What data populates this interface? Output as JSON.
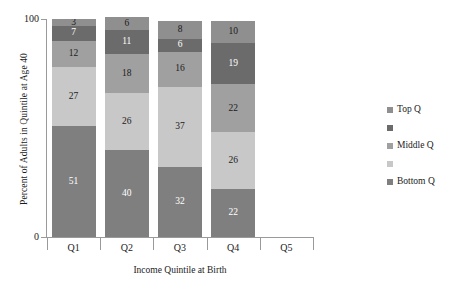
{
  "chart_data": {
    "type": "bar",
    "subtype": "stacked-bar-100-percent",
    "title": "",
    "xlabel": "Income Quintile at Birth",
    "ylabel": "Percent of Adults in Quintile at Age 40",
    "categories": [
      "Q1",
      "Q2",
      "Q3",
      "Q4",
      "Q5"
    ],
    "ylim": [
      0,
      100
    ],
    "ytick_labels": [
      "0",
      "100"
    ],
    "ytick_values": [
      0,
      100
    ],
    "grid": false,
    "legend_position": "right",
    "stack_order_bottom_to_top": [
      "Bottom Q",
      "series_2",
      "Middle Q",
      "series_4",
      "Top Q"
    ],
    "series": [
      {
        "name": "Bottom Q",
        "legend_label": "Bottom Q",
        "color": "#7f7f7f",
        "label_color": "#ffffff",
        "values": [
          51,
          40,
          32,
          22,
          null
        ]
      },
      {
        "name": "series_2",
        "legend_label": "",
        "color": "#c8c8c8",
        "label_color": "#1b1b1b",
        "values": [
          27,
          26,
          37,
          26,
          null
        ]
      },
      {
        "name": "Middle Q",
        "legend_label": "Middle Q",
        "color": "#a0a0a0",
        "label_color": "#1b1b1b",
        "values": [
          12,
          18,
          16,
          22,
          null
        ]
      },
      {
        "name": "series_4",
        "legend_label": "",
        "color": "#6b6b6b",
        "label_color": "#ffffff",
        "values": [
          7,
          11,
          6,
          19,
          null
        ]
      },
      {
        "name": "Top Q",
        "legend_label": "Top Q",
        "color": "#8f8f8f",
        "label_color": "#1b1b1b",
        "values": [
          3,
          6,
          8,
          10,
          null
        ]
      }
    ],
    "legend_entries_top_to_bottom": [
      {
        "label": "Top Q",
        "color": "#8f8f8f"
      },
      {
        "label": "",
        "color": "#6b6b6b"
      },
      {
        "label": "Middle Q",
        "color": "#a0a0a0"
      },
      {
        "label": "",
        "color": "#c8c8c8"
      },
      {
        "label": "Bottom Q",
        "color": "#7f7f7f"
      }
    ],
    "column_totals": [
      100,
      101,
      99,
      99,
      0
    ]
  },
  "axis": {
    "y_title": "Percent of Adults in Quintile at Age 40",
    "x_title": "Income Quintile at Birth",
    "y_tick_top": "100",
    "y_tick_bottom": "0"
  },
  "bars": [
    {
      "category": "Q1",
      "segments_top_to_bottom": [
        "3",
        "7",
        "12",
        "27",
        "51"
      ]
    },
    {
      "category": "Q2",
      "segments_top_to_bottom": [
        "6",
        "11",
        "18",
        "26",
        "40"
      ]
    },
    {
      "category": "Q3",
      "segments_top_to_bottom": [
        "8",
        "6",
        "16",
        "37",
        "32"
      ]
    },
    {
      "category": "Q4",
      "segments_top_to_bottom": [
        "10",
        "19",
        "22",
        "26",
        "22"
      ]
    },
    {
      "category": "Q5",
      "segments_top_to_bottom": []
    }
  ],
  "colors": {
    "axis_line": "#9a9a9a",
    "text": "#1b1b1b",
    "background": "#ffffff"
  }
}
